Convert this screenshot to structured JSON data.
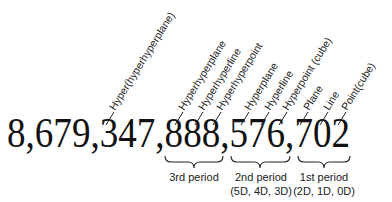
{
  "number": {
    "text": "8,679,347,888,576,702",
    "groups": [
      "8",
      "679",
      "347",
      "888",
      "576",
      "702"
    ]
  },
  "labels": [
    {
      "id": "hyper-hyperhyperplane",
      "text": "Hyper(hyperhyperplane)",
      "digit": "3 (of 347)"
    },
    {
      "id": "hyperhyperplane",
      "text": "Hyperhyperplane",
      "digit": "8 (hundreds, 888)"
    },
    {
      "id": "hyperhyperline",
      "text": "Hyperhyperline",
      "digit": "8 (tens, 888)"
    },
    {
      "id": "hyperhyperpoint",
      "text": "Hyperhyperpoint",
      "digit": "8 (ones, 888)"
    },
    {
      "id": "hyperplane",
      "text": "Hyperplane",
      "digit": "5"
    },
    {
      "id": "hyperline",
      "text": "Hyperline",
      "digit": "7 (of 576)"
    },
    {
      "id": "hyperpoint-cube",
      "text": "Hyperpoint (cube)",
      "digit": "6"
    },
    {
      "id": "plane",
      "text": "Plane",
      "digit": "7 (of 702)"
    },
    {
      "id": "line",
      "text": "Line",
      "digit": "0"
    },
    {
      "id": "point-cube",
      "text": "Point(cube)",
      "digit": "2"
    }
  ],
  "periods": [
    {
      "id": "3rd",
      "title": "3rd period",
      "subtitle": ""
    },
    {
      "id": "2nd",
      "title": "2nd period",
      "subtitle": "(5D, 4D, 3D)"
    },
    {
      "id": "1st",
      "title": "1st period",
      "subtitle": "(2D, 1D, 0D)"
    }
  ]
}
